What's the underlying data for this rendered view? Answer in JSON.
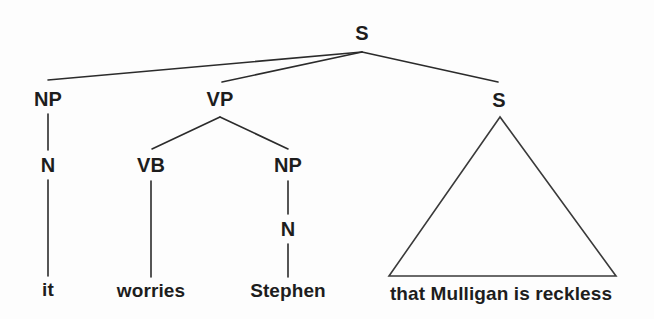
{
  "figure": {
    "type": "syntax-tree-diagram",
    "background_color": "#fdfdfd",
    "ink_color": "#1d1d1d",
    "sentence": "it worries Stephen that Mulligan is reckless"
  },
  "nodes": {
    "root_s": {
      "label": "S",
      "x": 362,
      "y": 33
    },
    "np_subject": {
      "label": "NP",
      "x": 48,
      "y": 99
    },
    "n_subject": {
      "label": "N",
      "x": 48,
      "y": 165
    },
    "leaf_it": {
      "label": "it",
      "x": 48,
      "y": 289
    },
    "vp": {
      "label": "VP",
      "x": 220,
      "y": 99
    },
    "vb": {
      "label": "VB",
      "x": 151,
      "y": 165
    },
    "leaf_worries": {
      "label": "worries",
      "x": 151,
      "y": 290
    },
    "np_object": {
      "label": "NP",
      "x": 288,
      "y": 165
    },
    "n_object": {
      "label": "N",
      "x": 288,
      "y": 229
    },
    "leaf_stephen": {
      "label": "Stephen",
      "x": 288,
      "y": 290
    },
    "s_embedded": {
      "label": "S",
      "x": 499,
      "y": 100
    },
    "leaf_clause": {
      "label": "that Mulligan is reckless",
      "x": 501,
      "y": 293
    }
  },
  "edges": [
    {
      "name": "s-to-np",
      "from": "root_s",
      "to": "np_subject",
      "path": "M 362 52 L 48 80"
    },
    {
      "name": "s-to-vp",
      "from": "root_s",
      "to": "vp",
      "path": "M 362 52 L 222 82"
    },
    {
      "name": "s-to-s-embedded",
      "from": "root_s",
      "to": "s_embedded",
      "path": "M 362 52 L 498 82"
    },
    {
      "name": "np-to-n",
      "from": "np_subject",
      "to": "n_subject",
      "path": "M 48 114 L 48 150"
    },
    {
      "name": "n-to-it",
      "from": "n_subject",
      "to": "leaf_it",
      "path": "M 48 180 L 48 276"
    },
    {
      "name": "vp-to-vb",
      "from": "vp",
      "to": "vb",
      "path": "M 220 117 L 152 149"
    },
    {
      "name": "vp-to-np",
      "from": "vp",
      "to": "np_object",
      "path": "M 220 117 L 288 149"
    },
    {
      "name": "vb-to-worries",
      "from": "vb",
      "to": "leaf_worries",
      "path": "M 151 181 L 151 277"
    },
    {
      "name": "np-to-n-object",
      "from": "np_object",
      "to": "n_object",
      "path": "M 288 181 L 288 214"
    },
    {
      "name": "n-to-stephen",
      "from": "n_object",
      "to": "leaf_stephen",
      "path": "M 288 244 L 288 277"
    }
  ],
  "triangle": {
    "name": "embedded-clause-triangle",
    "apex_x": 500,
    "apex_y": 117,
    "base_left_x": 389,
    "base_right_x": 616,
    "base_y": 276,
    "path": "M 500 117 L 389 276 L 616 276 Z"
  }
}
